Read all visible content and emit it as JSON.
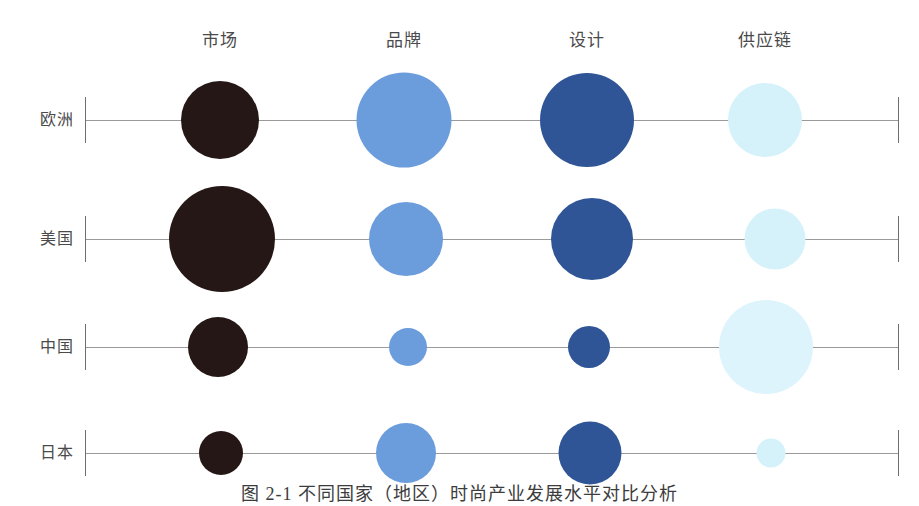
{
  "caption": "图 2-1  不同国家（地区）时尚产业发展水平对比分析",
  "chart_data": {
    "type": "bubble",
    "title": "图 2-1  不同国家（地区）时尚产业发展水平对比分析",
    "xlabel": "",
    "ylabel": "",
    "grid": false,
    "legend": "none",
    "categories": [
      "市场",
      "品牌",
      "设计",
      "供应链"
    ],
    "rows": [
      "欧洲",
      "美国",
      "中国",
      "日本"
    ],
    "series_colors": [
      "#241715",
      "#6b9cdb",
      "#2f5596",
      "#d5f2fb"
    ],
    "axis_color": "#9a9a9a",
    "column_x": [
      220,
      404,
      587,
      765
    ],
    "row_y": [
      120,
      239,
      347,
      453
    ],
    "axis_left_x": 85,
    "axis_right_x": 898,
    "bubbles": [
      {
        "row": "欧洲",
        "category": "市场",
        "cx": 220,
        "cy": 120,
        "d": 78,
        "color": "#241715",
        "value": 78
      },
      {
        "row": "欧洲",
        "category": "品牌",
        "cx": 404,
        "cy": 120,
        "d": 95,
        "color": "#6b9cdb",
        "value": 95
      },
      {
        "row": "欧洲",
        "category": "设计",
        "cx": 587,
        "cy": 120,
        "d": 94,
        "color": "#2f5596",
        "value": 94
      },
      {
        "row": "欧洲",
        "category": "供应链",
        "cx": 765,
        "cy": 120,
        "d": 74,
        "color": "#d5f2fb",
        "value": 74
      },
      {
        "row": "美国",
        "category": "市场",
        "cx": 222,
        "cy": 239,
        "d": 106,
        "color": "#241715",
        "value": 106
      },
      {
        "row": "美国",
        "category": "品牌",
        "cx": 406,
        "cy": 239,
        "d": 74,
        "color": "#6b9cdb",
        "value": 74
      },
      {
        "row": "美国",
        "category": "设计",
        "cx": 592,
        "cy": 239,
        "d": 82,
        "color": "#2f5596",
        "value": 82
      },
      {
        "row": "美国",
        "category": "供应链",
        "cx": 775,
        "cy": 239,
        "d": 61,
        "color": "#d5f2fb",
        "value": 61
      },
      {
        "row": "中国",
        "category": "市场",
        "cx": 218,
        "cy": 347,
        "d": 60,
        "color": "#241715",
        "value": 60
      },
      {
        "row": "中国",
        "category": "品牌",
        "cx": 408,
        "cy": 347,
        "d": 38,
        "color": "#6b9cdb",
        "value": 38
      },
      {
        "row": "中国",
        "category": "设计",
        "cx": 589,
        "cy": 347,
        "d": 42,
        "color": "#2f5596",
        "value": 42
      },
      {
        "row": "中国",
        "category": "供应链",
        "cx": 766,
        "cy": 347,
        "d": 94,
        "color": "#ddf4fc",
        "value": 94
      },
      {
        "row": "日本",
        "category": "市场",
        "cx": 221,
        "cy": 453,
        "d": 44,
        "color": "#241715",
        "value": 44
      },
      {
        "row": "日本",
        "category": "品牌",
        "cx": 406,
        "cy": 453,
        "d": 60,
        "color": "#6b9cdb",
        "value": 60
      },
      {
        "row": "日本",
        "category": "设计",
        "cx": 590,
        "cy": 453,
        "d": 63,
        "color": "#2f5596",
        "value": 63
      },
      {
        "row": "日本",
        "category": "供应链",
        "cx": 771,
        "cy": 453,
        "d": 29,
        "color": "#d5f2fb",
        "value": 29
      }
    ]
  }
}
